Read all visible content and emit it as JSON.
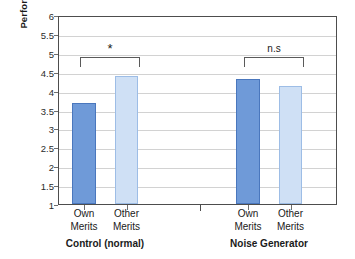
{
  "chart_data": {
    "type": "bar",
    "title": "",
    "xlabel": "",
    "ylabel": "Performance",
    "ylim": [
      1,
      6
    ],
    "ytick_step": 0.5,
    "yticks": [
      "6",
      "5.5",
      "5",
      "4.5",
      "4",
      "3.5",
      "3",
      "2.5",
      "2",
      "1.5",
      "1"
    ],
    "grid": true,
    "legend": "none",
    "groups": [
      {
        "name": "Control (normal)",
        "categories": [
          "Own Merits",
          "Other Merits"
        ],
        "values": [
          3.67,
          4.39
        ],
        "annotation": "*"
      },
      {
        "name": "Noise Generator",
        "categories": [
          "Own Merits",
          "Other Merits"
        ],
        "values": [
          4.32,
          4.12
        ],
        "annotation": "n.s"
      }
    ],
    "bars": [
      {
        "label_line1": "Own",
        "label_line2": "Merits",
        "value": 3.67,
        "group": "Control (normal)",
        "color": "#6f9ad8"
      },
      {
        "label_line1": "Other",
        "label_line2": "Merits",
        "value": 4.39,
        "group": "Control (normal)",
        "color": "#cfe0f5"
      },
      {
        "label_line1": "Own",
        "label_line2": "Merits",
        "value": 4.32,
        "group": "Noise Generator",
        "color": "#6f9ad8"
      },
      {
        "label_line1": "Other",
        "label_line2": "Merits",
        "value": 4.12,
        "group": "Noise Generator",
        "color": "#cfe0f5"
      }
    ],
    "annotations": [
      {
        "text": "*",
        "between": [
          0,
          1
        ],
        "significant": true
      },
      {
        "text": "n.s",
        "between": [
          2,
          3
        ],
        "significant": false
      }
    ],
    "colors": {
      "bar_own": "#6f9ad8",
      "bar_own_border": "#4a77bd",
      "bar_other": "#cfe0f5",
      "bar_other_border": "#9dbde6",
      "gridline": "#d2d2d2",
      "axis": "#4d4d4d",
      "text": "#1a1a1a",
      "background": "#ffffff"
    }
  }
}
